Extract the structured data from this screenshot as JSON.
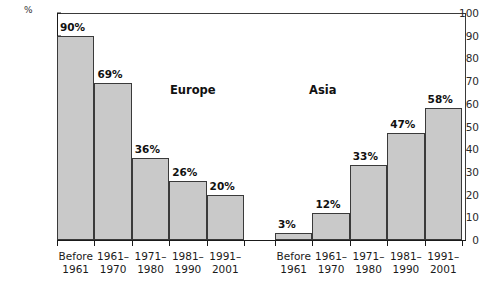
{
  "chart_data": {
    "type": "bar",
    "title": "",
    "xlabel": "",
    "ylabel": "%",
    "unit_label": "%",
    "ylim": [
      0,
      100
    ],
    "ytick_step": 10,
    "yticks": [
      0,
      10,
      20,
      30,
      40,
      50,
      60,
      70,
      80,
      90,
      100
    ],
    "ytick_labels": [
      "0",
      "10",
      "20",
      "30",
      "40",
      "50",
      "60",
      "70",
      "80",
      "90",
      "100"
    ],
    "grid": false,
    "legend": "none",
    "categories": [
      "Before 1961",
      "1961-1970",
      "1971-1980",
      "1981-1990",
      "1991-2001"
    ],
    "category_lines": [
      [
        "Before",
        "1961"
      ],
      [
        "1961–",
        "1970"
      ],
      [
        "1971–",
        "1980"
      ],
      [
        "1981–",
        "1990"
      ],
      [
        "1991–",
        "2001"
      ]
    ],
    "series": [
      {
        "name": "Europe",
        "values": [
          90,
          69,
          36,
          26,
          20
        ],
        "data_labels": [
          "90%",
          "69%",
          "36%",
          "26%",
          "20%"
        ]
      },
      {
        "name": "Asia",
        "values": [
          3,
          12,
          33,
          47,
          58
        ],
        "data_labels": [
          "3%",
          "12%",
          "33%",
          "47%",
          "58%"
        ]
      }
    ],
    "colors": {
      "bar_fill": "#c9c9c9",
      "bar_stroke": "#3a3a3a",
      "axis": "#1a1a1a",
      "text": "#111111"
    }
  },
  "groups": {
    "europe_label": "Europe",
    "asia_label": "Asia"
  }
}
